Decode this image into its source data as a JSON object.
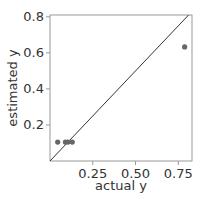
{
  "chart_data": {
    "type": "scatter",
    "title": "",
    "xlabel": "actual y",
    "ylabel": "estimated y",
    "xlim": [
      0.0,
      0.83
    ],
    "ylim": [
      0.0,
      0.81
    ],
    "xticks": [
      0.25,
      0.5,
      0.75
    ],
    "xtick_labels": [
      "0.25",
      "0.50",
      "0.75"
    ],
    "yticks": [
      0.2,
      0.4,
      0.6,
      0.8
    ],
    "ytick_labels": [
      "0.2",
      "0.4",
      "0.6",
      "0.8"
    ],
    "grid": false,
    "legend": null,
    "reference_line": {
      "type": "identity",
      "label": "y = x"
    },
    "points": [
      {
        "x": 0.045,
        "y": 0.105
      },
      {
        "x": 0.09,
        "y": 0.105
      },
      {
        "x": 0.105,
        "y": 0.105
      },
      {
        "x": 0.13,
        "y": 0.105
      },
      {
        "x": 0.787,
        "y": 0.633
      }
    ],
    "colors": {
      "point": "#666666",
      "line": "#333333",
      "frame": "#999999"
    }
  }
}
